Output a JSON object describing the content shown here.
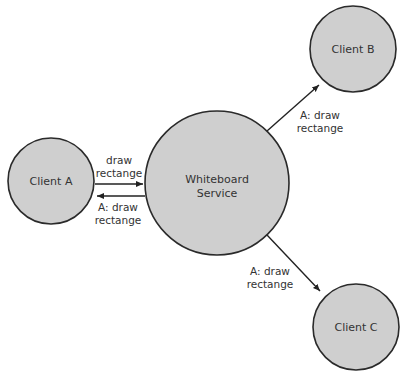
{
  "diagram": {
    "nodes": {
      "client_a": {
        "label": "Client A"
      },
      "service": {
        "line1": "Whiteboard",
        "line2": "Service"
      },
      "client_b": {
        "label": "Client B"
      },
      "client_c": {
        "label": "Client C"
      }
    },
    "edges": {
      "a_to_service": {
        "line1": "draw",
        "line2": "rectange"
      },
      "service_to_a": {
        "line1": "A: draw",
        "line2": "rectange"
      },
      "service_to_b": {
        "line1": "A: draw",
        "line2": "rectange"
      },
      "service_to_c": {
        "line1": "A: draw",
        "line2": "rectange"
      }
    },
    "colors": {
      "node_fill": "#cfcfcf",
      "stroke": "#2a2a2a",
      "text": "#333333"
    }
  }
}
